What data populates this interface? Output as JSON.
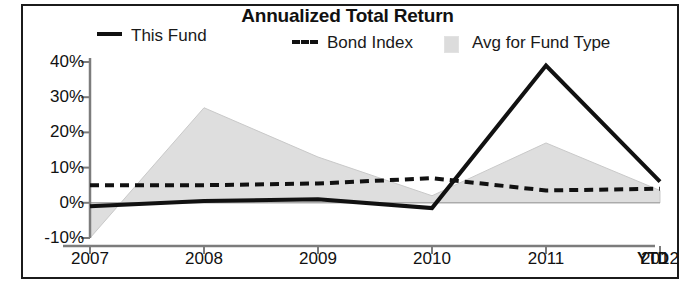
{
  "chart_data": {
    "type": "area",
    "title": "Annualized Total Return",
    "xlabel": "",
    "ylabel": "",
    "x": [
      "2007",
      "2008",
      "2009",
      "2010",
      "2011",
      "2012"
    ],
    "categories": [
      "2007",
      "2008",
      "2009",
      "2010",
      "2011",
      "2012"
    ],
    "x_note": "YTD",
    "ylim": [
      -10,
      40
    ],
    "yticks": [
      40,
      30,
      20,
      10,
      0,
      -10
    ],
    "ytick_labels": [
      "40%",
      "30%",
      "20%",
      "10%",
      "0%",
      "-10%"
    ],
    "xtick_labels": [
      "2007",
      "2008",
      "2009",
      "2010",
      "2011",
      "2012"
    ],
    "grid": false,
    "legend_position": "top",
    "series": [
      {
        "name": "This Fund",
        "style": "solid-line",
        "color": "#111111",
        "values": [
          -1,
          0.5,
          1,
          -1.5,
          39,
          6
        ]
      },
      {
        "name": "Bond Index",
        "style": "dashed-line",
        "color": "#111111",
        "values": [
          5,
          5,
          5.5,
          7,
          3.5,
          4
        ]
      },
      {
        "name": "Avg for Fund Type",
        "style": "filled-area",
        "color": "#dedede",
        "values": [
          -10,
          27,
          13,
          2,
          17,
          3.5
        ]
      }
    ]
  },
  "legend": {
    "items": [
      {
        "label": "This Fund",
        "swatch": "solid-line-swatch"
      },
      {
        "label": "Bond Index",
        "swatch": "dashed-line-swatch"
      },
      {
        "label": "Avg for Fund Type",
        "swatch": "area-fill-swatch"
      }
    ]
  },
  "axis": {
    "y_labels": [
      "40%",
      "30%",
      "20%",
      "10%",
      "0%",
      "-10%"
    ],
    "x_labels": [
      "2007",
      "2008",
      "2009",
      "2010",
      "2011",
      "2012"
    ],
    "ytd": "YTD"
  },
  "title": "Annualized Total Return"
}
